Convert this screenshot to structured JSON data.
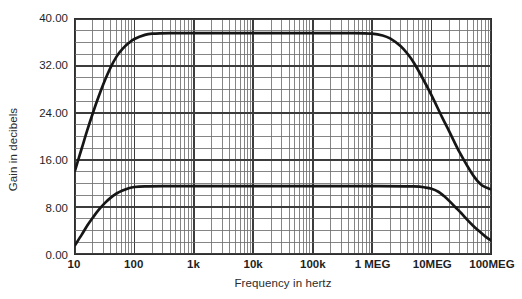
{
  "chart_data": {
    "type": "line",
    "title": "",
    "xlabel": "Frequency in hertz",
    "ylabel": "Gain in decibels",
    "xscale": "log",
    "xlim": [
      10,
      100000000
    ],
    "ylim": [
      0,
      40
    ],
    "grid": true,
    "grid_style": "log-log semilog paper, major decade lines plus log minor lines",
    "legend": "none",
    "y_major_step": 8,
    "y_minor_step": 2,
    "xticks": [
      10,
      100,
      1000,
      10000,
      100000,
      1000000,
      10000000,
      100000000
    ],
    "xticklabels": [
      "10",
      "100",
      "1k",
      "10k",
      "100k",
      "1 MEG",
      "10MEG",
      "100MEG"
    ],
    "yticks": [
      0,
      8,
      16,
      24,
      32,
      40
    ],
    "yticklabels": [
      "0.00",
      "8.00",
      "16.00",
      "24.00",
      "32.00",
      "40.00"
    ],
    "series": [
      {
        "name": "upper-gain-curve",
        "color": "#161616",
        "points": [
          [
            10,
            14.2
          ],
          [
            13,
            18.0
          ],
          [
            16,
            21.0
          ],
          [
            20,
            24.0
          ],
          [
            25,
            26.8
          ],
          [
            32,
            29.6
          ],
          [
            40,
            31.8
          ],
          [
            50,
            33.6
          ],
          [
            63,
            34.9
          ],
          [
            80,
            35.9
          ],
          [
            100,
            36.6
          ],
          [
            150,
            37.3
          ],
          [
            200,
            37.5
          ],
          [
            400,
            37.6
          ],
          [
            1000,
            37.6
          ],
          [
            10000,
            37.6
          ],
          [
            100000,
            37.6
          ],
          [
            500000,
            37.6
          ],
          [
            1000000,
            37.5
          ],
          [
            1500000,
            37.2
          ],
          [
            2000000,
            36.7
          ],
          [
            3000000,
            35.4
          ],
          [
            4000000,
            34.0
          ],
          [
            5000000,
            32.6
          ],
          [
            7000000,
            30.0
          ],
          [
            10000000,
            27.0
          ],
          [
            15000000,
            23.3
          ],
          [
            20000000,
            20.8
          ],
          [
            30000000,
            17.2
          ],
          [
            50000000,
            13.4
          ],
          [
            70000000,
            11.7
          ],
          [
            100000000,
            11.0
          ]
        ]
      },
      {
        "name": "lower-gain-curve",
        "color": "#161616",
        "points": [
          [
            10,
            1.5
          ],
          [
            13,
            3.3
          ],
          [
            16,
            4.8
          ],
          [
            20,
            6.2
          ],
          [
            25,
            7.5
          ],
          [
            32,
            8.7
          ],
          [
            40,
            9.6
          ],
          [
            50,
            10.3
          ],
          [
            63,
            10.8
          ],
          [
            80,
            11.2
          ],
          [
            100,
            11.4
          ],
          [
            150,
            11.5
          ],
          [
            300,
            11.55
          ],
          [
            1000,
            11.55
          ],
          [
            10000,
            11.55
          ],
          [
            100000,
            11.55
          ],
          [
            1000000,
            11.55
          ],
          [
            5000000,
            11.5
          ],
          [
            8000000,
            11.3
          ],
          [
            10000000,
            11.1
          ],
          [
            13000000,
            10.6
          ],
          [
            16000000,
            9.9
          ],
          [
            20000000,
            9.0
          ],
          [
            25000000,
            8.0
          ],
          [
            32000000,
            6.9
          ],
          [
            40000000,
            5.8
          ],
          [
            50000000,
            4.8
          ],
          [
            63000000,
            3.9
          ],
          [
            80000000,
            3.0
          ],
          [
            100000000,
            2.3
          ]
        ]
      }
    ]
  },
  "axes": {
    "y_title": "Gain in decibels",
    "x_title": "Frequency in hertz",
    "y_labels": [
      "40.00",
      "32.00",
      "24.00",
      "16.00",
      "8.00",
      "0.00"
    ],
    "x_labels": [
      "10",
      "100",
      "1k",
      "10k",
      "100k",
      "1 MEG",
      "10MEG",
      "100MEG"
    ]
  },
  "colors": {
    "curve": "#161616",
    "grid_major": "#3c3c3c",
    "grid_minor": "#6e6e6e",
    "frame": "#2e2e2e",
    "background": "#ffffff",
    "text": "#1f1f1f"
  }
}
